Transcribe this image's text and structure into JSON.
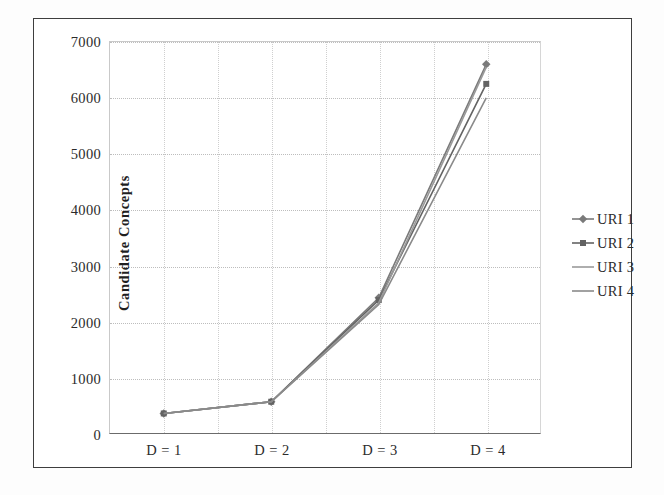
{
  "chart_data": {
    "type": "line",
    "title": "",
    "xlabel": "",
    "ylabel": "Candidate Concepts",
    "categories": [
      "D = 1",
      "D = 2",
      "D = 3",
      "D = 4"
    ],
    "ylim": [
      0,
      7000
    ],
    "ytick_step": 1000,
    "yticks": [
      "0",
      "1000",
      "2000",
      "3000",
      "4000",
      "5000",
      "6000",
      "7000"
    ],
    "grid": "both",
    "legend_position": "right",
    "series": [
      {
        "name": "URI 1",
        "values": [
          350,
          560,
          2420,
          6600
        ],
        "color": "#7a7a7a",
        "marker": "diamond"
      },
      {
        "name": "URI 2",
        "values": [
          350,
          560,
          2380,
          6250
        ],
        "color": "#636363",
        "marker": "square"
      },
      {
        "name": "URI 3",
        "values": [
          350,
          560,
          2330,
          6550
        ],
        "color": "#9a9a9a",
        "marker": "none"
      },
      {
        "name": "URI 4",
        "values": [
          350,
          560,
          2300,
          6000
        ],
        "color": "#8a8a8a",
        "marker": "none"
      }
    ]
  },
  "axes": {
    "yticks": [
      {
        "label": "7000",
        "value": 7000
      },
      {
        "label": "6000",
        "value": 6000
      },
      {
        "label": "5000",
        "value": 5000
      },
      {
        "label": "4000",
        "value": 4000
      },
      {
        "label": "3000",
        "value": 3000
      },
      {
        "label": "2000",
        "value": 2000
      },
      {
        "label": "1000",
        "value": 1000
      },
      {
        "label": "0",
        "value": 0
      }
    ],
    "xticks": [
      {
        "label": "D = 1"
      },
      {
        "label": "D = 2"
      },
      {
        "label": "D = 3"
      },
      {
        "label": "D = 4"
      }
    ],
    "y_axis_title": "Candidate Concepts"
  },
  "legend": {
    "items": [
      {
        "label": "URI 1"
      },
      {
        "label": "URI 2"
      },
      {
        "label": "URI 3"
      },
      {
        "label": "URI 4"
      }
    ]
  }
}
